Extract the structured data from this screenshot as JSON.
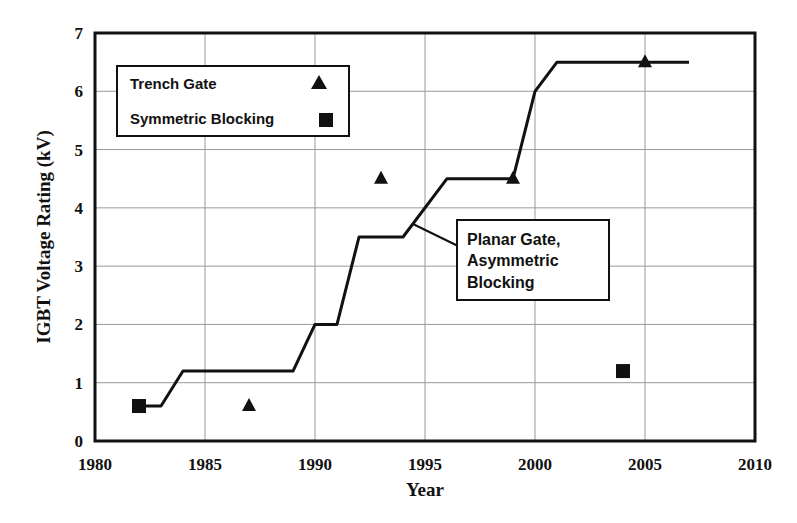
{
  "chart_data": {
    "type": "line",
    "title": "",
    "xlabel": "Year",
    "ylabel": "IGBT Voltage Rating  (kV)",
    "xlim": [
      1980,
      2010
    ],
    "ylim": [
      0,
      7
    ],
    "x_ticks": [
      "1980",
      "1985",
      "1990",
      "1995",
      "2000",
      "2005",
      "2010"
    ],
    "y_ticks": [
      "0",
      "1",
      "2",
      "3",
      "4",
      "5",
      "6",
      "7"
    ],
    "grid": true,
    "series": [
      {
        "name": "Planar Gate, Asymmetric Blocking",
        "style": "line",
        "points": [
          [
            1982,
            0.6
          ],
          [
            1983,
            0.6
          ],
          [
            1984,
            1.2
          ],
          [
            1989,
            1.2
          ],
          [
            1990,
            2.0
          ],
          [
            1991,
            2.0
          ],
          [
            1992,
            3.5
          ],
          [
            1994,
            3.5
          ],
          [
            1996,
            4.5
          ],
          [
            1999,
            4.5
          ],
          [
            2000,
            6.0
          ],
          [
            2001,
            6.5
          ],
          [
            2007,
            6.5
          ]
        ]
      },
      {
        "name": "Trench Gate",
        "style": "triangle-marker",
        "points": [
          [
            1987,
            0.6
          ],
          [
            1993,
            4.5
          ],
          [
            1999,
            4.5
          ],
          [
            2005,
            6.5
          ]
        ]
      },
      {
        "name": "Symmetric Blocking",
        "style": "square-marker",
        "points": [
          [
            1982,
            0.6
          ],
          [
            2004,
            1.2
          ]
        ]
      }
    ],
    "legend": [
      {
        "label": "Trench Gate",
        "marker": "triangle"
      },
      {
        "label": "Symmetric Blocking",
        "marker": "square"
      }
    ],
    "annotation": {
      "lines": [
        "Planar Gate,",
        "Asymmetric",
        "Blocking"
      ],
      "points_to": [
        1994.5,
        3.7
      ]
    }
  }
}
